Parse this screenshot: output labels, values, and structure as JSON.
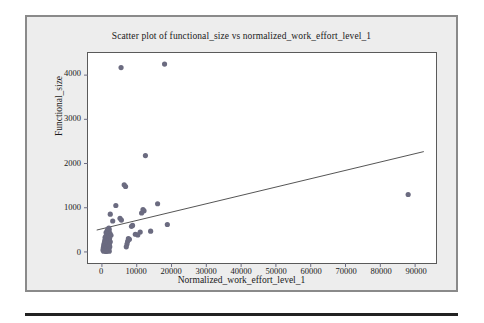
{
  "figure": {
    "background_color": "#ededed",
    "border_color": "#8a8a8a",
    "plot_background_color": "#ffffff",
    "axis_color": "#5a5a5a"
  },
  "chart_data": {
    "type": "scatter",
    "title": "Scatter plot of functional_size vs normalized_work_effort_level_1",
    "xlabel": "Normalized_work_effort_level_1",
    "ylabel": "Functional_size",
    "xlim": [
      -4000,
      96000
    ],
    "ylim": [
      -250,
      4500
    ],
    "xticks": [
      0,
      10000,
      20000,
      30000,
      40000,
      50000,
      60000,
      70000,
      80000,
      90000
    ],
    "xticklabels": [
      "0",
      "10000",
      "20000",
      "30000",
      "40000",
      "50000",
      "60000",
      "70000",
      "80000",
      "90000"
    ],
    "yticks": [
      0,
      1000,
      2000,
      3000,
      4000
    ],
    "yticklabels": [
      "0",
      "1000",
      "2000",
      "3000",
      "4000"
    ],
    "grid": false,
    "legend": null,
    "marker_color": "#6b6b80",
    "marker_size": 4,
    "trendline": {
      "type": "linear",
      "color": "#404040",
      "x_start": -1500,
      "y_start": 495,
      "x_end": 92500,
      "y_end": 2270
    },
    "points": [
      {
        "x": 5500,
        "y": 4170
      },
      {
        "x": 18000,
        "y": 4250
      },
      {
        "x": 12500,
        "y": 2180
      },
      {
        "x": 6400,
        "y": 1520
      },
      {
        "x": 6800,
        "y": 1480
      },
      {
        "x": 88000,
        "y": 1300
      },
      {
        "x": 16000,
        "y": 1090
      },
      {
        "x": 4000,
        "y": 1050
      },
      {
        "x": 11800,
        "y": 960
      },
      {
        "x": 12100,
        "y": 930
      },
      {
        "x": 2400,
        "y": 855
      },
      {
        "x": 11400,
        "y": 880
      },
      {
        "x": 5200,
        "y": 760
      },
      {
        "x": 5600,
        "y": 720
      },
      {
        "x": 3100,
        "y": 700
      },
      {
        "x": 18800,
        "y": 620
      },
      {
        "x": 8800,
        "y": 600
      },
      {
        "x": 8500,
        "y": 580
      },
      {
        "x": 2000,
        "y": 540
      },
      {
        "x": 1700,
        "y": 520
      },
      {
        "x": 2100,
        "y": 500
      },
      {
        "x": 1500,
        "y": 480
      },
      {
        "x": 1900,
        "y": 465
      },
      {
        "x": 14000,
        "y": 470
      },
      {
        "x": 11000,
        "y": 450
      },
      {
        "x": 1200,
        "y": 440
      },
      {
        "x": 1800,
        "y": 430
      },
      {
        "x": 2300,
        "y": 420
      },
      {
        "x": 1400,
        "y": 410
      },
      {
        "x": 9600,
        "y": 400
      },
      {
        "x": 10300,
        "y": 385
      },
      {
        "x": 2600,
        "y": 375
      },
      {
        "x": 1600,
        "y": 365
      },
      {
        "x": 1100,
        "y": 355
      },
      {
        "x": 2000,
        "y": 345
      },
      {
        "x": 1350,
        "y": 335
      },
      {
        "x": 900,
        "y": 325
      },
      {
        "x": 1750,
        "y": 315
      },
      {
        "x": 2200,
        "y": 305
      },
      {
        "x": 1250,
        "y": 295
      },
      {
        "x": 7600,
        "y": 300
      },
      {
        "x": 7900,
        "y": 285
      },
      {
        "x": 1000,
        "y": 275
      },
      {
        "x": 1550,
        "y": 265
      },
      {
        "x": 2050,
        "y": 258
      },
      {
        "x": 800,
        "y": 250
      },
      {
        "x": 1300,
        "y": 242
      },
      {
        "x": 1850,
        "y": 235
      },
      {
        "x": 7400,
        "y": 240
      },
      {
        "x": 2400,
        "y": 228
      },
      {
        "x": 950,
        "y": 220
      },
      {
        "x": 1450,
        "y": 212
      },
      {
        "x": 700,
        "y": 205
      },
      {
        "x": 1150,
        "y": 198
      },
      {
        "x": 1700,
        "y": 190
      },
      {
        "x": 2150,
        "y": 185
      },
      {
        "x": 7200,
        "y": 180
      },
      {
        "x": 600,
        "y": 172
      },
      {
        "x": 1050,
        "y": 165
      },
      {
        "x": 1500,
        "y": 158
      },
      {
        "x": 1900,
        "y": 152
      },
      {
        "x": 850,
        "y": 145
      },
      {
        "x": 1300,
        "y": 138
      },
      {
        "x": 500,
        "y": 130
      },
      {
        "x": 1650,
        "y": 125
      },
      {
        "x": 2250,
        "y": 120
      },
      {
        "x": 7000,
        "y": 115
      },
      {
        "x": 950,
        "y": 110
      },
      {
        "x": 1400,
        "y": 102
      },
      {
        "x": 400,
        "y": 95
      },
      {
        "x": 1800,
        "y": 90
      },
      {
        "x": 1100,
        "y": 82
      },
      {
        "x": 600,
        "y": 75
      },
      {
        "x": 1550,
        "y": 68
      },
      {
        "x": 2000,
        "y": 62
      },
      {
        "x": 800,
        "y": 55
      },
      {
        "x": 1250,
        "y": 48
      },
      {
        "x": 300,
        "y": 42
      },
      {
        "x": 1700,
        "y": 38
      },
      {
        "x": 1000,
        "y": 30
      },
      {
        "x": 1450,
        "y": 22
      },
      {
        "x": 500,
        "y": 18
      },
      {
        "x": 2100,
        "y": 15
      },
      {
        "x": 1200,
        "y": 10
      }
    ]
  }
}
